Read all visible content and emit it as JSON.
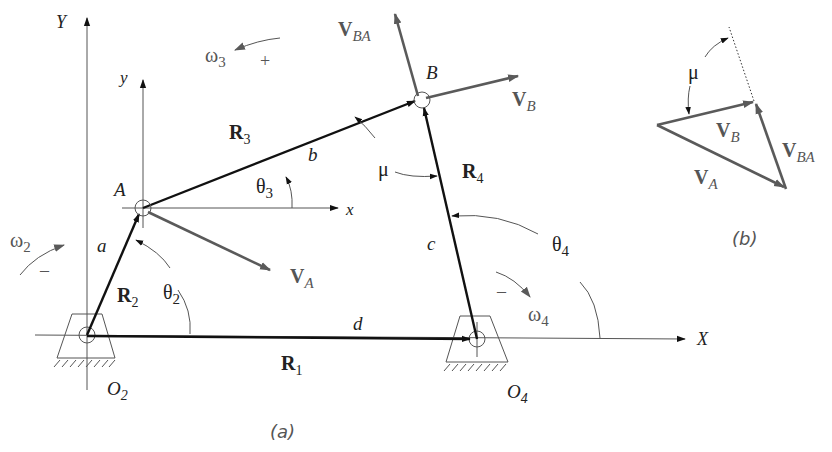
{
  "figure": {
    "subfigure_a": {
      "caption": "(a)",
      "axes": {
        "global_x": "X",
        "global_y": "Y",
        "local_x": "x",
        "local_y": "y"
      },
      "points": {
        "A": "A",
        "B": "B",
        "O2": "O",
        "O2_sub": "2",
        "O4": "O",
        "O4_sub": "4"
      },
      "links": {
        "R1": {
          "label": "R",
          "sub": "1",
          "length": "d"
        },
        "R2": {
          "label": "R",
          "sub": "2",
          "length": "a"
        },
        "R3": {
          "label": "R",
          "sub": "3",
          "length": "b"
        },
        "R4": {
          "label": "R",
          "sub": "4",
          "length": "c"
        }
      },
      "angles": {
        "theta2": {
          "sym": "θ",
          "sub": "2"
        },
        "theta3": {
          "sym": "θ",
          "sub": "3"
        },
        "theta4": {
          "sym": "θ",
          "sub": "4"
        },
        "mu": {
          "sym": "μ"
        }
      },
      "angular_velocities": {
        "omega2": {
          "sym": "ω",
          "sub": "2",
          "sign": "–"
        },
        "omega3": {
          "sym": "ω",
          "sub": "3",
          "sign": "+"
        },
        "omega4": {
          "sym": "ω",
          "sub": "4",
          "sign": "–"
        }
      },
      "velocities": {
        "VA": {
          "sym": "V",
          "sub": "A"
        },
        "VB": {
          "sym": "V",
          "sub": "B"
        },
        "VBA": {
          "sym": "V",
          "sub": "BA"
        }
      }
    },
    "subfigure_b": {
      "caption": "(b)",
      "vectors": {
        "VA": {
          "sym": "V",
          "sub": "A"
        },
        "VB": {
          "sym": "V",
          "sub": "B"
        },
        "VBA": {
          "sym": "V",
          "sub": "BA"
        }
      },
      "angle": {
        "sym": "μ"
      }
    },
    "colors": {
      "link": "#111111",
      "velocity": "#5a5a5a",
      "axis": "#555555",
      "label": "#222222"
    }
  }
}
